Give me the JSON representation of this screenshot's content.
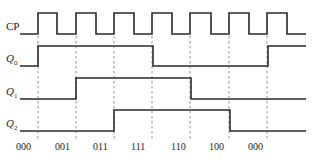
{
  "diagram": {
    "signals": [
      {
        "name": "CP",
        "label": "CP",
        "sub": "",
        "high_y": 13,
        "low_y": 34,
        "points": [
          [
            20,
            34
          ],
          [
            38,
            34
          ],
          [
            38,
            13
          ],
          [
            57,
            13
          ],
          [
            57,
            34
          ],
          [
            76,
            34
          ],
          [
            76,
            13
          ],
          [
            96,
            13
          ],
          [
            96,
            34
          ],
          [
            114,
            34
          ],
          [
            114,
            13
          ],
          [
            134,
            13
          ],
          [
            134,
            34
          ],
          [
            152,
            34
          ],
          [
            152,
            13
          ],
          [
            172,
            13
          ],
          [
            172,
            34
          ],
          [
            190,
            34
          ],
          [
            190,
            13
          ],
          [
            211,
            13
          ],
          [
            211,
            34
          ],
          [
            229,
            34
          ],
          [
            229,
            13
          ],
          [
            249,
            13
          ],
          [
            249,
            34
          ],
          [
            267,
            34
          ],
          [
            267,
            13
          ],
          [
            287,
            13
          ],
          [
            287,
            34
          ],
          [
            306,
            34
          ]
        ]
      },
      {
        "name": "Q0",
        "label": "Q",
        "sub": "0",
        "high_y": 46,
        "low_y": 66,
        "points": [
          [
            20,
            66
          ],
          [
            38,
            66
          ],
          [
            38,
            46
          ],
          [
            153,
            46
          ],
          [
            153,
            66
          ],
          [
            268,
            66
          ],
          [
            268,
            46
          ],
          [
            306,
            46
          ]
        ]
      },
      {
        "name": "Q1",
        "label": "Q",
        "sub": "1",
        "high_y": 78,
        "low_y": 99,
        "points": [
          [
            20,
            99
          ],
          [
            76,
            99
          ],
          [
            76,
            78
          ],
          [
            191,
            78
          ],
          [
            191,
            99
          ],
          [
            306,
            99
          ]
        ]
      },
      {
        "name": "Q2",
        "label": "Q",
        "sub": "2",
        "high_y": 110,
        "low_y": 131,
        "points": [
          [
            20,
            131
          ],
          [
            114,
            131
          ],
          [
            114,
            110
          ],
          [
            230,
            110
          ],
          [
            230,
            131
          ],
          [
            306,
            131
          ]
        ]
      }
    ],
    "clock_edges_x": [
      38,
      76,
      114,
      152,
      190,
      229,
      267
    ],
    "states": [
      {
        "text": "000",
        "x": 16
      },
      {
        "text": "001",
        "x": 55
      },
      {
        "text": "011",
        "x": 93
      },
      {
        "text": "111",
        "x": 131
      },
      {
        "text": "110",
        "x": 171
      },
      {
        "text": "100",
        "x": 209
      },
      {
        "text": "000",
        "x": 248
      }
    ]
  }
}
